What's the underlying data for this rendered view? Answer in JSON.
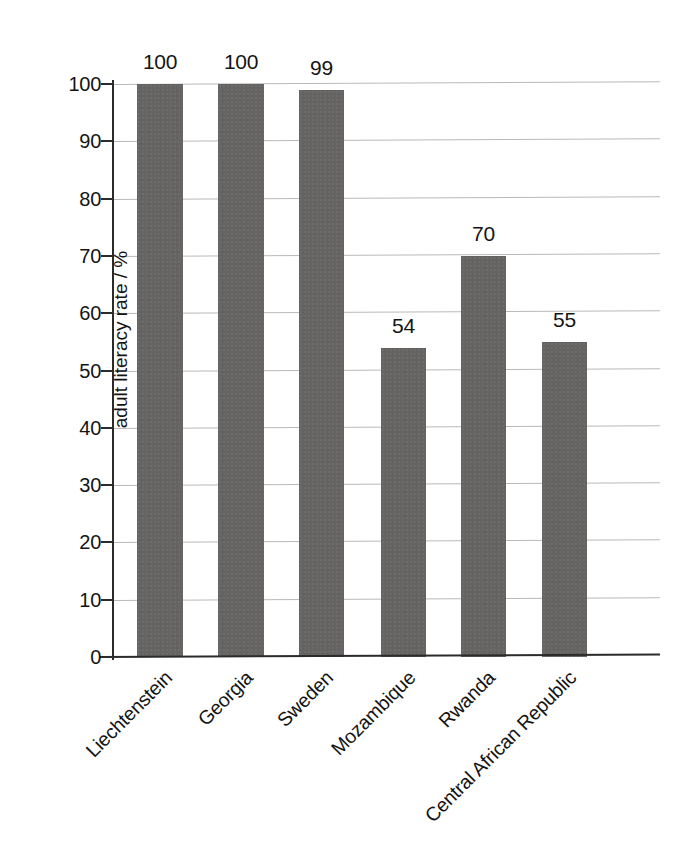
{
  "chart_data": {
    "type": "bar",
    "title": "",
    "xlabel": "",
    "ylabel": "adult literacy rate / %",
    "ylim": [
      0,
      100
    ],
    "ytick_step": 10,
    "grid": true,
    "legend": null,
    "bar_color": "#666463",
    "gridline_color": "#b9b9b9",
    "axis_color": "#2b2b2b",
    "categories": [
      "Liechtenstein",
      "Georgia",
      "Sweden",
      "Mozambique",
      "Rwanda",
      "Central African Republic"
    ],
    "values": [
      100,
      100,
      99,
      54,
      70,
      55
    ],
    "value_labels": [
      "100",
      "100",
      "99",
      "54",
      "70",
      "55"
    ],
    "yticks": [
      {
        "value": 100,
        "label": "100"
      },
      {
        "value": 90,
        "label": "90"
      },
      {
        "value": 80,
        "label": "80"
      },
      {
        "value": 70,
        "label": "70"
      },
      {
        "value": 60,
        "label": "60"
      },
      {
        "value": 50,
        "label": "50"
      },
      {
        "value": 40,
        "label": "40"
      },
      {
        "value": 30,
        "label": "30"
      },
      {
        "value": 20,
        "label": "20"
      },
      {
        "value": 10,
        "label": "10"
      },
      {
        "value": 0,
        "label": "0"
      }
    ]
  }
}
